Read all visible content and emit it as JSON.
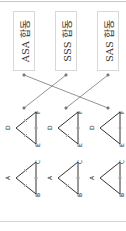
{
  "conditions": [
    {
      "label": "ASA 합동"
    },
    {
      "label": "SSS 합동"
    },
    {
      "label": "SAS 합동"
    }
  ],
  "triangle_pairs": [
    {
      "t1": {
        "A": "A",
        "B": "B",
        "C": "C"
      },
      "t2": {
        "D": "D",
        "E": "E",
        "F": "F"
      }
    },
    {
      "t1": {
        "A": "A",
        "B": "B",
        "C": "C"
      },
      "t2": {
        "D": "D",
        "E": "E",
        "F": "F"
      }
    },
    {
      "t1": {
        "A": "A",
        "B": "B",
        "C": "C"
      },
      "t2": {
        "D": "D",
        "E": "E",
        "F": "F"
      }
    }
  ],
  "connections": [
    {
      "from": "ASA 합동",
      "to_pair": 3
    },
    {
      "from": "SSS 합동",
      "to_pair": 1
    },
    {
      "from": "SAS 합동",
      "to_pair": 2
    }
  ]
}
